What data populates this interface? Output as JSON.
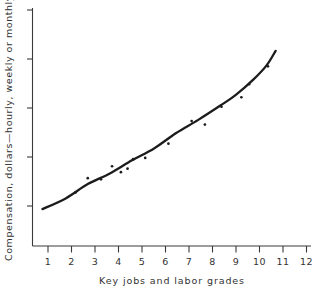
{
  "chart_data": {
    "type": "scatter",
    "title": "",
    "xlabel": "Key jobs and labor grades",
    "ylabel": "Compensation, dollars—hourly, weekly or monthly",
    "xlim": [
      0,
      12.6
    ],
    "ylim": [
      0,
      10
    ],
    "grid": false,
    "legend": null,
    "xticks": [
      1,
      2,
      3,
      4,
      5,
      6,
      7,
      8,
      9,
      10,
      11,
      12
    ],
    "xtick_labels": [
      "1",
      "2",
      "3",
      "4",
      "5",
      "6",
      "7",
      "8",
      "9",
      "10",
      "11",
      "12"
    ],
    "ytick_labels": [],
    "yticks": [
      1.55,
      3.45,
      5.35,
      7.25,
      9.2
    ],
    "series": [
      {
        "name": "Key job compensation rates",
        "type": "scatter",
        "points": [
          {
            "x": 1.95,
            "y": 2.25
          },
          {
            "x": 2.5,
            "y": 2.85
          },
          {
            "x": 3.1,
            "y": 2.8
          },
          {
            "x": 3.6,
            "y": 3.35
          },
          {
            "x": 4.0,
            "y": 3.1
          },
          {
            "x": 4.3,
            "y": 3.25
          },
          {
            "x": 4.55,
            "y": 3.65
          },
          {
            "x": 5.1,
            "y": 3.7
          },
          {
            "x": 6.15,
            "y": 4.3
          },
          {
            "x": 7.2,
            "y": 5.25
          },
          {
            "x": 7.8,
            "y": 5.1
          },
          {
            "x": 8.55,
            "y": 5.85
          },
          {
            "x": 9.45,
            "y": 6.25
          },
          {
            "x": 9.8,
            "y": 6.8
          },
          {
            "x": 10.65,
            "y": 7.55
          }
        ]
      },
      {
        "name": "Fitted wage curve",
        "type": "line",
        "points": [
          {
            "x": 0.45,
            "y": 1.55
          },
          {
            "x": 1.5,
            "y": 2.0
          },
          {
            "x": 2.5,
            "y": 2.6
          },
          {
            "x": 3.5,
            "y": 3.05
          },
          {
            "x": 4.5,
            "y": 3.6
          },
          {
            "x": 5.5,
            "y": 4.1
          },
          {
            "x": 6.5,
            "y": 4.75
          },
          {
            "x": 7.5,
            "y": 5.3
          },
          {
            "x": 8.5,
            "y": 5.9
          },
          {
            "x": 9.2,
            "y": 6.35
          },
          {
            "x": 10.0,
            "y": 7.0
          },
          {
            "x": 10.6,
            "y": 7.6
          },
          {
            "x": 11.0,
            "y": 8.2
          }
        ]
      }
    ]
  },
  "axes": {
    "x_title": "Key jobs and labor grades",
    "y_title": "Compensation, dollars—hourly, weekly or monthly",
    "x_tick_labels": [
      "1",
      "2",
      "3",
      "4",
      "5",
      "6",
      "7",
      "8",
      "9",
      "10",
      "11",
      "12"
    ]
  },
  "colors": {
    "axis": "#3a3a3a",
    "curve": "#1c1c1c",
    "point": "#1c1c1c",
    "background": "#ffffff",
    "text": "#333333"
  }
}
